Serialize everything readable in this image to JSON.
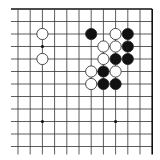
{
  "diagram": {
    "type": "go-board-fragment",
    "colors": {
      "background": "#ffffff",
      "line": "#333333",
      "edge": "#111111",
      "black_stone": "#111111",
      "white_stone": "#ffffff",
      "stone_outline": "#222222"
    },
    "grid": {
      "cols": 12,
      "rows": 12,
      "x0": 18,
      "y0": 9,
      "dx": 12.2,
      "dy": 12.5,
      "top_edge": true,
      "right_edge": true,
      "left_open": true,
      "bottom_open": true
    },
    "star_points": [
      {
        "col": 2,
        "row": 3
      },
      {
        "col": 2,
        "row": 9
      },
      {
        "col": 8,
        "row": 9
      }
    ],
    "stones": [
      {
        "color": "white",
        "col": 2,
        "row": 2
      },
      {
        "color": "white",
        "col": 2,
        "row": 4
      },
      {
        "color": "black",
        "col": 6,
        "row": 2
      },
      {
        "color": "white",
        "col": 8,
        "row": 2
      },
      {
        "color": "black",
        "col": 9,
        "row": 2
      },
      {
        "color": "white",
        "col": 7,
        "row": 3
      },
      {
        "color": "white",
        "col": 8,
        "row": 3
      },
      {
        "color": "black",
        "col": 9,
        "row": 3
      },
      {
        "color": "white",
        "col": 7,
        "row": 4
      },
      {
        "color": "black",
        "col": 8,
        "row": 4
      },
      {
        "color": "black",
        "col": 9,
        "row": 4
      },
      {
        "color": "white",
        "col": 6,
        "row": 5
      },
      {
        "color": "black",
        "col": 7,
        "row": 5
      },
      {
        "color": "white",
        "col": 8,
        "row": 5
      },
      {
        "color": "white",
        "col": 6,
        "row": 6
      },
      {
        "color": "black",
        "col": 7,
        "row": 6
      },
      {
        "color": "black",
        "col": 8,
        "row": 6
      }
    ]
  }
}
